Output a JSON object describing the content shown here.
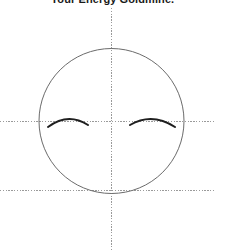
{
  "title": {
    "text": "Your Energy Goldmine.",
    "cropped": true
  },
  "figure": {
    "background_color": "#ffffff",
    "circle": {
      "name": "head-circle",
      "cx": 111.5,
      "cy": 121,
      "r": 72.5,
      "stroke": "#6b6b6b",
      "stroke_width": 1,
      "fill": "none"
    },
    "axes": {
      "vertical": {
        "name": "vertical-axis-line",
        "x": 111,
        "y1": 8,
        "y2": 251,
        "stroke": "#9a9a9a",
        "stroke_width": 1,
        "dash": "1.4 1.4"
      },
      "horizontal_mid": {
        "name": "horizontal-axis-line",
        "y": 121,
        "x1": 0,
        "x2": 216,
        "stroke": "#9a9a9a",
        "stroke_width": 1,
        "dash": "1.4 1.4"
      },
      "horizontal_lower": {
        "name": "baseline-axis-line",
        "y": 190,
        "x1": 0,
        "x2": 216,
        "stroke": "#9a9a9a",
        "stroke_width": 1,
        "dash": "1.4 1.4"
      }
    },
    "arcs": [
      {
        "name": "left-eye-arc",
        "path": "M 48 127 Q 68 112 88 125",
        "stroke": "#1f1f1f",
        "stroke_width": 2,
        "fill": "none"
      },
      {
        "name": "right-eye-arc",
        "path": "M 130 125 Q 152 112 175 127",
        "stroke": "#1f1f1f",
        "stroke_width": 2,
        "fill": "none"
      }
    ]
  }
}
